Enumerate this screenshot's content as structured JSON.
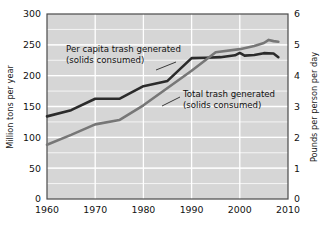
{
  "chart_data": {
    "type": "line",
    "title": "",
    "subtitle": "",
    "xlabel": "",
    "ylabel": "Million tons per year",
    "y2label": "Pounds per person per day",
    "xlim": [
      1960,
      2010
    ],
    "ylim": [
      0,
      300
    ],
    "y2lim": [
      0,
      6
    ],
    "xticks": [
      "1960",
      "1970",
      "1980",
      "1990",
      "2000",
      "2010"
    ],
    "xtick_values": [
      1960,
      1970,
      1980,
      1990,
      2000,
      2010
    ],
    "yticks": [
      "0",
      "50",
      "100",
      "150",
      "200",
      "250",
      "300"
    ],
    "ytick_values": [
      0,
      50,
      100,
      150,
      200,
      250,
      300
    ],
    "y2ticks": [
      "0",
      "1",
      "2",
      "3",
      "4",
      "5",
      "6"
    ],
    "y2tick_values": [
      0,
      1,
      2,
      3,
      4,
      5,
      6
    ],
    "grid": true,
    "grid_minor_y_step": 25,
    "legend_position": "inline-annotations",
    "plot_background": "#d6d6d6",
    "grid_color": "#ffffff",
    "series": [
      {
        "name": "Per capita trash generated (solids consumed)",
        "axis": "right",
        "color": "#2b2b2b",
        "width": 2.6,
        "x": [
          1960,
          1965,
          1970,
          1975,
          1980,
          1985,
          1990,
          1993,
          1996,
          1999,
          2000,
          2001,
          2003,
          2005,
          2007,
          2008
        ],
        "values": [
          2.68,
          2.88,
          3.25,
          3.25,
          3.66,
          3.83,
          4.57,
          4.58,
          4.6,
          4.66,
          4.74,
          4.65,
          4.67,
          4.73,
          4.72,
          4.6
        ]
      },
      {
        "name": "Total trash generated (solids consumed)",
        "axis": "left",
        "color": "#777777",
        "width": 2.6,
        "x": [
          1960,
          1965,
          1970,
          1975,
          1980,
          1985,
          1990,
          1995,
          2000,
          2003,
          2005,
          2006,
          2007,
          2008
        ],
        "values": [
          88,
          104,
          121,
          128,
          152,
          180,
          208,
          238,
          243,
          248,
          253,
          258,
          256,
          255
        ]
      }
    ],
    "annotations": [
      {
        "id": "per-capita-label",
        "lines": [
          "Per capita trash generated",
          "(solids consumed)"
        ],
        "x": 66,
        "y": 52,
        "leader": {
          "x1": 156,
          "y1": 70,
          "x2": 176,
          "y2": 62
        }
      },
      {
        "id": "total-label",
        "lines": [
          "Total trash generated",
          "(solids consumed)"
        ],
        "x": 183,
        "y": 97,
        "leader": {
          "x1": 162,
          "y1": 106,
          "x2": 180,
          "y2": 97
        }
      }
    ]
  },
  "axes": {
    "left_title": "Million tons per year",
    "right_title": "Pounds per person per day"
  }
}
